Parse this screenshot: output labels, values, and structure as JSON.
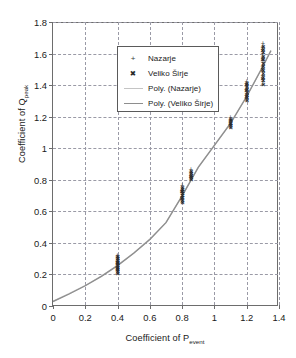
{
  "chart_data": {
    "type": "scatter",
    "title": "",
    "xlabel": "Coefficient of P_event",
    "xlabel_main": "Coefficient of P",
    "xlabel_sub": "event",
    "ylabel": "Coefficient of Q_peak",
    "ylabel_main": "Coefficient of Q",
    "ylabel_sub": "peak",
    "xlim": [
      0,
      1.4
    ],
    "ylim": [
      0,
      1.8
    ],
    "xticks": [
      0,
      0.2,
      0.4,
      0.6,
      0.8,
      1,
      1.2,
      1.4
    ],
    "xtick_labels": [
      "0",
      "0.2",
      "0.4",
      "0.6",
      "0.8",
      "1",
      "1.2",
      "1.4"
    ],
    "yticks": [
      0,
      0.2,
      0.4,
      0.6,
      0.8,
      1,
      1.2,
      1.4,
      1.6,
      1.8
    ],
    "ytick_labels": [
      "0",
      "0.2",
      "0.4",
      "0.6",
      "0.8",
      "1",
      "1.2",
      "1.4",
      "1.6",
      "1.8"
    ],
    "grid": "dashed-both",
    "legend_position": "top-left-inside",
    "legend": [
      {
        "label": "Nazarje",
        "marker": "plus",
        "type": "scatter",
        "color": "#3c3c3c"
      },
      {
        "label": "Veliko Širje",
        "marker": "cross",
        "type": "scatter",
        "color": "#2a2a2a"
      },
      {
        "label": "Poly. (Nazarje)",
        "marker": "line",
        "type": "trend",
        "color": "#c4c4c4"
      },
      {
        "label": "Poly. (Veliko Širje)",
        "marker": "line",
        "type": "trend",
        "color": "#8e8e8e"
      }
    ],
    "series": [
      {
        "name": "Nazarje",
        "marker": "plus",
        "points": [
          [
            0.4,
            0.205
          ],
          [
            0.4,
            0.215
          ],
          [
            0.4,
            0.225
          ],
          [
            0.4,
            0.232
          ],
          [
            0.4,
            0.24
          ],
          [
            0.4,
            0.248
          ],
          [
            0.4,
            0.256
          ],
          [
            0.4,
            0.263
          ],
          [
            0.4,
            0.271
          ],
          [
            0.4,
            0.279
          ],
          [
            0.4,
            0.287
          ],
          [
            0.4,
            0.295
          ],
          [
            0.4,
            0.303
          ],
          [
            0.4,
            0.311
          ],
          [
            0.4,
            0.318
          ],
          [
            0.401,
            0.228
          ],
          [
            0.399,
            0.265
          ],
          [
            0.401,
            0.29
          ],
          [
            0.8,
            0.655
          ],
          [
            0.8,
            0.668
          ],
          [
            0.8,
            0.68
          ],
          [
            0.8,
            0.692
          ],
          [
            0.8,
            0.703
          ],
          [
            0.8,
            0.714
          ],
          [
            0.8,
            0.726
          ],
          [
            0.8,
            0.737
          ],
          [
            0.8,
            0.749
          ],
          [
            0.8,
            0.76
          ],
          [
            0.801,
            0.69
          ],
          [
            0.799,
            0.72
          ],
          [
            0.855,
            0.8
          ],
          [
            0.855,
            0.812
          ],
          [
            0.855,
            0.824
          ],
          [
            0.855,
            0.836
          ],
          [
            0.855,
            0.848
          ],
          [
            0.855,
            0.86
          ],
          [
            0.856,
            0.818
          ],
          [
            0.854,
            0.842
          ],
          [
            1.1,
            1.13
          ],
          [
            1.1,
            1.143
          ],
          [
            1.1,
            1.155
          ],
          [
            1.1,
            1.166
          ],
          [
            1.1,
            1.178
          ],
          [
            1.1,
            1.19
          ],
          [
            1.101,
            1.15
          ],
          [
            1.099,
            1.172
          ],
          [
            1.2,
            1.3
          ],
          [
            1.2,
            1.315
          ],
          [
            1.2,
            1.33
          ],
          [
            1.2,
            1.345
          ],
          [
            1.2,
            1.36
          ],
          [
            1.2,
            1.375
          ],
          [
            1.2,
            1.39
          ],
          [
            1.2,
            1.405
          ],
          [
            1.2,
            1.42
          ],
          [
            1.201,
            1.338
          ],
          [
            1.199,
            1.368
          ],
          [
            1.201,
            1.398
          ],
          [
            1.3,
            1.4
          ],
          [
            1.3,
            1.42
          ],
          [
            1.3,
            1.44
          ],
          [
            1.3,
            1.46
          ],
          [
            1.3,
            1.48
          ],
          [
            1.3,
            1.5
          ],
          [
            1.3,
            1.52
          ],
          [
            1.3,
            1.54
          ],
          [
            1.3,
            1.56
          ],
          [
            1.3,
            1.58
          ],
          [
            1.3,
            1.6
          ],
          [
            1.3,
            1.62
          ],
          [
            1.3,
            1.64
          ],
          [
            1.3,
            1.66
          ],
          [
            1.301,
            1.455
          ],
          [
            1.299,
            1.515
          ],
          [
            1.301,
            1.575
          ],
          [
            1.299,
            1.635
          ]
        ]
      },
      {
        "name": "Veliko Širje",
        "marker": "cross",
        "points": [
          [
            0.402,
            0.21
          ],
          [
            0.402,
            0.222
          ],
          [
            0.402,
            0.234
          ],
          [
            0.402,
            0.246
          ],
          [
            0.402,
            0.258
          ],
          [
            0.402,
            0.27
          ],
          [
            0.402,
            0.282
          ],
          [
            0.402,
            0.294
          ],
          [
            0.402,
            0.306
          ],
          [
            0.402,
            0.316
          ],
          [
            0.398,
            0.238
          ],
          [
            0.398,
            0.276
          ],
          [
            0.802,
            0.66
          ],
          [
            0.802,
            0.674
          ],
          [
            0.802,
            0.688
          ],
          [
            0.802,
            0.702
          ],
          [
            0.802,
            0.716
          ],
          [
            0.802,
            0.73
          ],
          [
            0.802,
            0.744
          ],
          [
            0.802,
            0.756
          ],
          [
            0.798,
            0.684
          ],
          [
            0.798,
            0.726
          ],
          [
            0.857,
            0.804
          ],
          [
            0.857,
            0.818
          ],
          [
            0.857,
            0.832
          ],
          [
            0.857,
            0.846
          ],
          [
            0.857,
            0.857
          ],
          [
            0.853,
            0.826
          ],
          [
            1.102,
            1.134
          ],
          [
            1.102,
            1.148
          ],
          [
            1.102,
            1.162
          ],
          [
            1.102,
            1.176
          ],
          [
            1.102,
            1.188
          ],
          [
            1.098,
            1.158
          ],
          [
            1.202,
            1.305
          ],
          [
            1.202,
            1.322
          ],
          [
            1.202,
            1.34
          ],
          [
            1.202,
            1.358
          ],
          [
            1.202,
            1.376
          ],
          [
            1.202,
            1.394
          ],
          [
            1.202,
            1.412
          ],
          [
            1.198,
            1.33
          ],
          [
            1.198,
            1.368
          ],
          [
            1.198,
            1.404
          ],
          [
            1.302,
            1.41
          ],
          [
            1.302,
            1.432
          ],
          [
            1.302,
            1.454
          ],
          [
            1.302,
            1.476
          ],
          [
            1.302,
            1.498
          ],
          [
            1.302,
            1.52
          ],
          [
            1.302,
            1.542
          ],
          [
            1.302,
            1.564
          ],
          [
            1.302,
            1.586
          ],
          [
            1.302,
            1.608
          ],
          [
            1.302,
            1.63
          ],
          [
            1.302,
            1.65
          ],
          [
            1.298,
            1.445
          ],
          [
            1.298,
            1.505
          ],
          [
            1.298,
            1.565
          ],
          [
            1.298,
            1.62
          ]
        ]
      }
    ],
    "trends": [
      {
        "name": "Poly. (Nazarje)",
        "color": "#c4c4c4",
        "points": [
          [
            0.0,
            0.03
          ],
          [
            0.1,
            0.078
          ],
          [
            0.2,
            0.13
          ],
          [
            0.3,
            0.19
          ],
          [
            0.4,
            0.258
          ],
          [
            0.5,
            0.336
          ],
          [
            0.6,
            0.424
          ],
          [
            0.7,
            0.53
          ],
          [
            0.8,
            0.7
          ],
          [
            0.9,
            0.88
          ],
          [
            1.0,
            1.02
          ],
          [
            1.1,
            1.16
          ],
          [
            1.2,
            1.33
          ],
          [
            1.3,
            1.52
          ],
          [
            1.35,
            1.62
          ]
        ]
      },
      {
        "name": "Poly. (Veliko Širje)",
        "color": "#8e8e8e",
        "points": [
          [
            0.0,
            0.028
          ],
          [
            0.1,
            0.076
          ],
          [
            0.2,
            0.128
          ],
          [
            0.3,
            0.188
          ],
          [
            0.4,
            0.256
          ],
          [
            0.5,
            0.334
          ],
          [
            0.6,
            0.422
          ],
          [
            0.7,
            0.528
          ],
          [
            0.8,
            0.698
          ],
          [
            0.9,
            0.878
          ],
          [
            1.0,
            1.018
          ],
          [
            1.1,
            1.158
          ],
          [
            1.2,
            1.328
          ],
          [
            1.3,
            1.518
          ],
          [
            1.35,
            1.618
          ]
        ]
      }
    ]
  }
}
